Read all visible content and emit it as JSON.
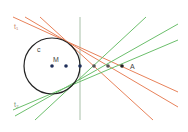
{
  "labels": {
    "circle": "c",
    "center": "M",
    "point_a": "A",
    "tangent_1": "t₁",
    "tangent_2": "t₂"
  },
  "colors": {
    "circle": "#222222",
    "orange_lines": "#e8825a",
    "green_lines": "#6cbf6c",
    "vertical_line": "#8aaa8a",
    "points": "#1f2f5a"
  },
  "points_on_axis_count": 6
}
